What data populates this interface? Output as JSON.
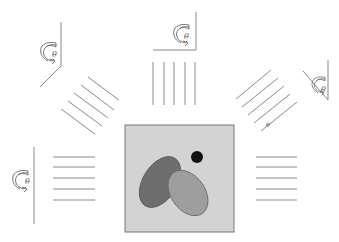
{
  "diagram": {
    "colors": {
      "background": "#ffffff",
      "lines": "#8a8a8a",
      "square_fill": "#d3d3d3",
      "square_border": "#777777",
      "dark_ellipse": "#6e6e6e",
      "light_ellipse": "#9e9e9e",
      "dot": "#111111"
    },
    "object": {
      "square": {
        "x": 125,
        "y": 125,
        "w": 109,
        "h": 107
      },
      "dot": {
        "cx": 197,
        "cy": 157,
        "r": 6
      },
      "dark_ellipse": {
        "cx": 160,
        "cy": 182,
        "rx": 17,
        "ry": 28,
        "rotate": 32
      },
      "light_ellipse": {
        "cx": 188,
        "cy": 193,
        "rx": 17,
        "ry": 25,
        "rotate": -35
      }
    },
    "projections": [
      {
        "id": "left",
        "angle_label": "θ"
      },
      {
        "id": "top-left",
        "angle_label": "θ"
      },
      {
        "id": "top",
        "angle_label": "θ"
      },
      {
        "id": "top-right",
        "angle_label": "θ"
      },
      {
        "id": "right",
        "angle_label": ""
      }
    ],
    "ray_label": "θ"
  }
}
